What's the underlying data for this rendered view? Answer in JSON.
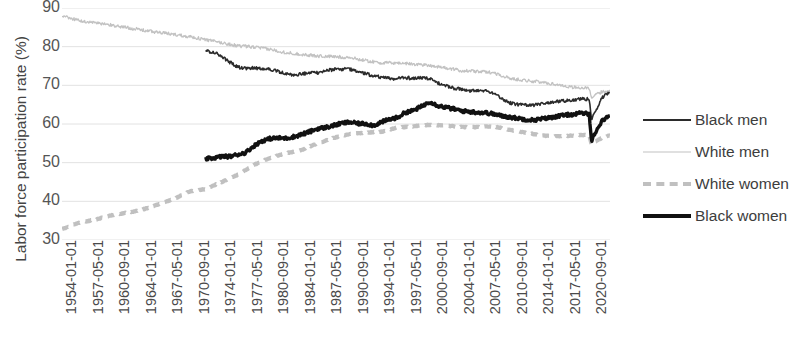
{
  "chart_data": {
    "type": "line",
    "title": "",
    "xlabel": "",
    "ylabel": "Labor force participation rate (%)",
    "ylim": [
      30,
      90
    ],
    "yticks": [
      30,
      40,
      50,
      60,
      70,
      80,
      90
    ],
    "grid": true,
    "legend_position": "right",
    "xlim": [
      "1954-01-01",
      "2022-09-01"
    ],
    "categories": [
      "1954-01-01",
      "1957-05-01",
      "1960-09-01",
      "1964-01-01",
      "1967-05-01",
      "1970-09-01",
      "1974-01-01",
      "1977-05-01",
      "1980-09-01",
      "1984-01-01",
      "1987-05-01",
      "1990-09-01",
      "1994-01-01",
      "1997-05-01",
      "2000-09-01",
      "2004-01-01",
      "2007-05-01",
      "2010-09-01",
      "2014-01-01",
      "2017-05-01",
      "2020-09-01"
    ],
    "series": [
      {
        "name": "Black men",
        "color": "#2b2b2b",
        "style": "solid",
        "width": 1.6,
        "start_category": "1972-01-01",
        "x": [
          1972.0,
          1973.0,
          1974.0,
          1975.0,
          1976.0,
          1977.0,
          1978.0,
          1979.0,
          1980.0,
          1981.0,
          1982.0,
          1983.0,
          1984.0,
          1985.0,
          1986.0,
          1987.0,
          1988.0,
          1989.0,
          1990.0,
          1991.0,
          1992.0,
          1993.0,
          1994.0,
          1995.0,
          1996.0,
          1997.0,
          1998.0,
          1999.0,
          2000.0,
          2001.0,
          2002.0,
          2003.0,
          2004.0,
          2005.0,
          2006.0,
          2007.0,
          2008.0,
          2009.0,
          2010.0,
          2011.0,
          2012.0,
          2013.0,
          2014.0,
          2015.0,
          2016.0,
          2017.0,
          2018.0,
          2019.0,
          2020.0,
          2020.3,
          2020.5,
          2021.0,
          2021.5,
          2022.0,
          2022.6
        ],
        "values": [
          79.0,
          78.5,
          77.5,
          76.0,
          74.8,
          74.3,
          74.5,
          74.4,
          74.2,
          73.6,
          73.0,
          72.6,
          73.0,
          73.1,
          73.3,
          73.8,
          74.1,
          74.2,
          74.2,
          73.6,
          73.0,
          72.5,
          72.0,
          71.8,
          71.7,
          72.0,
          71.8,
          72.0,
          71.8,
          70.6,
          69.9,
          69.3,
          68.9,
          68.5,
          68.8,
          68.7,
          68.0,
          66.7,
          65.5,
          65.1,
          65.0,
          64.9,
          65.2,
          65.5,
          65.8,
          66.0,
          66.3,
          66.5,
          66.4,
          60.9,
          62.4,
          64.0,
          66.5,
          67.5,
          68.4
        ]
      },
      {
        "name": "White men",
        "color": "#c2c2c2",
        "style": "solid",
        "width": 1.3,
        "start_category": "1954-01-01",
        "x": [
          1954.0,
          1956.0,
          1958.0,
          1960.0,
          1962.0,
          1964.0,
          1966.0,
          1968.0,
          1970.0,
          1972.0,
          1974.0,
          1976.0,
          1978.0,
          1980.0,
          1982.0,
          1984.0,
          1986.0,
          1988.0,
          1990.0,
          1992.0,
          1994.0,
          1996.0,
          1998.0,
          2000.0,
          2002.0,
          2004.0,
          2006.0,
          2008.0,
          2010.0,
          2012.0,
          2014.0,
          2016.0,
          2018.0,
          2019.5,
          2020.0,
          2020.3,
          2020.5,
          2021.0,
          2021.5,
          2022.0,
          2022.6
        ],
        "values": [
          87.9,
          86.8,
          86.2,
          85.6,
          85.0,
          84.3,
          83.7,
          83.2,
          82.6,
          81.8,
          81.0,
          80.2,
          79.9,
          79.3,
          78.5,
          78.0,
          77.6,
          77.4,
          77.2,
          76.4,
          75.8,
          75.8,
          75.5,
          75.2,
          74.5,
          73.8,
          73.6,
          73.3,
          71.8,
          71.3,
          70.8,
          70.2,
          69.5,
          69.3,
          69.1,
          66.6,
          67.0,
          67.8,
          68.2,
          68.5,
          68.8
        ]
      },
      {
        "name": "White women",
        "color": "#c0c0c0",
        "style": "dashed",
        "width": 4.2,
        "start_category": "1954-01-01",
        "x": [
          1954.0,
          1956.0,
          1958.0,
          1960.0,
          1962.0,
          1964.0,
          1966.0,
          1968.0,
          1970.0,
          1972.0,
          1974.0,
          1976.0,
          1978.0,
          1980.0,
          1982.0,
          1984.0,
          1986.0,
          1988.0,
          1990.0,
          1992.0,
          1994.0,
          1996.0,
          1998.0,
          2000.0,
          2002.0,
          2004.0,
          2006.0,
          2008.0,
          2010.0,
          2012.0,
          2014.0,
          2016.0,
          2018.0,
          2019.5,
          2020.0,
          2020.3,
          2020.5,
          2021.0,
          2021.5,
          2022.0,
          2022.6
        ],
        "values": [
          32.8,
          34.4,
          35.2,
          36.3,
          37.0,
          37.8,
          39.2,
          40.6,
          42.6,
          43.2,
          45.0,
          46.9,
          49.4,
          51.2,
          52.4,
          53.3,
          55.0,
          56.4,
          57.4,
          57.8,
          58.0,
          59.1,
          59.4,
          59.8,
          59.6,
          59.2,
          59.2,
          59.4,
          58.5,
          57.8,
          57.0,
          56.8,
          57.0,
          57.2,
          57.3,
          54.6,
          55.2,
          55.8,
          56.3,
          56.7,
          57.0
        ]
      },
      {
        "name": "Black women",
        "color": "#111111",
        "style": "solid",
        "width": 3.4,
        "start_category": "1972-01-01",
        "x": [
          1972.0,
          1973.0,
          1974.0,
          1975.0,
          1976.0,
          1977.0,
          1978.0,
          1979.0,
          1980.0,
          1981.0,
          1982.0,
          1983.0,
          1984.0,
          1985.0,
          1986.0,
          1987.0,
          1988.0,
          1989.0,
          1990.0,
          1991.0,
          1992.0,
          1993.0,
          1994.0,
          1995.0,
          1996.0,
          1997.0,
          1998.0,
          1999.0,
          2000.0,
          2001.0,
          2002.0,
          2003.0,
          2004.0,
          2005.0,
          2006.0,
          2007.0,
          2008.0,
          2009.0,
          2010.0,
          2011.0,
          2012.0,
          2013.0,
          2014.0,
          2015.0,
          2016.0,
          2017.0,
          2018.0,
          2019.0,
          2020.0,
          2020.3,
          2020.5,
          2021.0,
          2021.5,
          2022.0,
          2022.6
        ],
        "values": [
          51.0,
          51.2,
          51.6,
          51.6,
          52.1,
          52.6,
          54.3,
          55.6,
          56.2,
          56.4,
          56.3,
          56.7,
          57.3,
          58.0,
          58.8,
          59.1,
          59.6,
          60.2,
          60.5,
          60.1,
          60.1,
          59.6,
          60.5,
          61.2,
          61.7,
          63.0,
          63.5,
          64.5,
          65.8,
          64.8,
          64.3,
          63.9,
          63.4,
          63.2,
          63.0,
          62.9,
          62.6,
          62.1,
          61.8,
          61.5,
          61.2,
          61.0,
          61.3,
          61.6,
          62.0,
          62.3,
          62.5,
          62.8,
          62.6,
          55.2,
          57.0,
          58.5,
          60.5,
          61.5,
          62.2
        ]
      }
    ]
  },
  "legend": {
    "items": [
      {
        "label": "Black men"
      },
      {
        "label": "White men"
      },
      {
        "label": "White women"
      },
      {
        "label": "Black women"
      }
    ]
  }
}
